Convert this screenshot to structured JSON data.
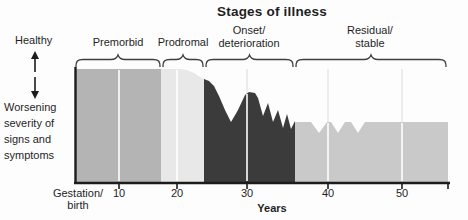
{
  "figure": {
    "title": "Stages of illness",
    "y_axis": {
      "top_label": "Healthy",
      "bottom_label": "Worsening\nseverity of\nsigns and\nsymptoms"
    },
    "x_axis_label": "Years"
  },
  "chart_data": {
    "type": "area",
    "title": "Stages of illness",
    "xlabel": "Years",
    "ylabel": "Severity of signs and symptoms (downward = worsening)",
    "legend": "none",
    "grid": "faint vertical gridlines at each decade",
    "x_ticks": [
      {
        "label": "Gestation/\nbirth",
        "years": 0,
        "x_px": 78,
        "tick": false,
        "grid_top_px": 70
      },
      {
        "label": "10",
        "years": 10,
        "x_px": 119,
        "tick": true,
        "grid_top_px": 70
      },
      {
        "label": "20",
        "years": 20,
        "x_px": 177,
        "tick": true,
        "grid_top_px": 70
      },
      {
        "label": "30",
        "years": 30,
        "x_px": 247,
        "tick": true,
        "grid_top_px": 94
      },
      {
        "label": "40",
        "years": 40,
        "x_px": 328,
        "tick": true,
        "grid_top_px": 123
      },
      {
        "label": "50",
        "years": 50,
        "x_px": 402,
        "tick": true,
        "grid_top_px": 123
      }
    ],
    "axis_px": {
      "left": 75,
      "right": 450,
      "baseline": 182,
      "top": 69,
      "end_tick_x": 448
    },
    "stages": [
      {
        "name": "premorbid",
        "label": "Premorbid",
        "years": [
          0,
          17
        ],
        "severity": "healthy baseline, flat",
        "fill": "#b4b4b4",
        "bracket_px": [
          76,
          160
        ],
        "label_cx": 118,
        "label_top": 36,
        "x_range_px": [
          75,
          161
        ],
        "profile_px": [
          [
            75,
            69
          ],
          [
            161,
            69
          ]
        ]
      },
      {
        "name": "prodromal",
        "label": "Prodromal",
        "years": [
          17,
          24
        ],
        "severity": "slight gradual worsening",
        "fill": "#e8e8e8",
        "bracket_px": [
          163,
          203
        ],
        "label_cx": 183,
        "label_top": 36,
        "x_range_px": [
          161,
          204
        ],
        "profile_px": [
          [
            161,
            69
          ],
          [
            180,
            69
          ],
          [
            187,
            70
          ],
          [
            194,
            73
          ],
          [
            200,
            77
          ],
          [
            204,
            79
          ]
        ]
      },
      {
        "name": "onset-deterioration",
        "label": "Onset/\ndeterioration",
        "years": [
          24,
          36
        ],
        "severity": "severe fluctuating deterioration (jagged peaks and valleys)",
        "fill": "#3b3b3b",
        "bracket_px": [
          206,
          293
        ],
        "label_cx": 249,
        "label_top": 24,
        "x_range_px": [
          204,
          295
        ],
        "profile_px": [
          [
            204,
            79
          ],
          [
            209,
            81
          ],
          [
            214,
            86
          ],
          [
            219,
            96
          ],
          [
            225,
            110
          ],
          [
            231,
            122
          ],
          [
            238,
            110
          ],
          [
            245,
            95
          ],
          [
            249,
            92
          ],
          [
            255,
            93
          ],
          [
            258,
            98
          ],
          [
            263,
            116
          ],
          [
            268,
            103
          ],
          [
            273,
            122
          ],
          [
            278,
            110
          ],
          [
            283,
            128
          ],
          [
            287,
            114
          ],
          [
            291,
            129
          ],
          [
            295,
            121
          ]
        ]
      },
      {
        "name": "residual-stable",
        "label": "Residual/\nstable",
        "years": [
          36,
          56
        ],
        "severity": "stable moderate impairment with small notched fluctuations",
        "fill": "#c9c9c9",
        "bracket_px": [
          296,
          446
        ],
        "label_cx": 370,
        "label_top": 24,
        "x_range_px": [
          295,
          448
        ],
        "profile_px": [
          [
            295,
            122
          ],
          [
            311,
            122
          ],
          [
            319,
            133
          ],
          [
            327,
            122
          ],
          [
            331,
            122
          ],
          [
            338,
            133
          ],
          [
            345,
            122
          ],
          [
            351,
            122
          ],
          [
            358,
            133
          ],
          [
            365,
            122
          ],
          [
            448,
            122
          ]
        ]
      }
    ],
    "colors": {
      "axis": "#1c1c1c",
      "bracket": "#3f3f3f",
      "text": "#1f1f1f",
      "gridline_over_fill": "rgba(255,255,255,0.8)",
      "gridline_on_background": "#ececec",
      "background": "#fdfdfd"
    }
  }
}
